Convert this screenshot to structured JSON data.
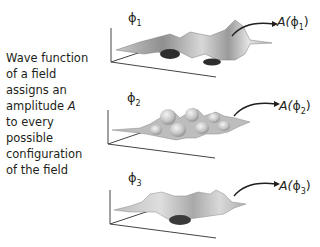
{
  "caption": {
    "lines": [
      "Wave function",
      "of a field",
      "assigns an",
      "amplitude",
      "to every",
      "possible",
      "configuration",
      "of the field"
    ],
    "italic_symbol": "A"
  },
  "panels": [
    {
      "phi_symbol": "ϕ",
      "phi_index": "1",
      "amplitude_prefix": "A(",
      "amplitude_symbol": "ϕ",
      "amplitude_index": "1",
      "amplitude_suffix": ")",
      "surface": "irregular-bumpy-surface"
    },
    {
      "phi_symbol": "ϕ",
      "phi_index": "2",
      "amplitude_prefix": "A(",
      "amplitude_symbol": "ϕ",
      "amplitude_index": "2",
      "amplitude_suffix": ")",
      "surface": "regular-wave-surface"
    },
    {
      "phi_symbol": "ϕ",
      "phi_index": "3",
      "amplitude_prefix": "A(",
      "amplitude_symbol": "ϕ",
      "amplitude_index": "3",
      "amplitude_suffix": ")",
      "surface": "smooth-undulating-surface"
    }
  ],
  "colors": {
    "text": "#231f20",
    "axis": "#444444",
    "surface_light": "#e6e6e6",
    "surface_mid": "#a8a8a8",
    "surface_dark": "#3a3a3a"
  }
}
